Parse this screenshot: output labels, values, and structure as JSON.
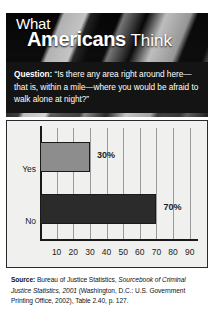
{
  "figure": {
    "title_line1": "What",
    "title_line2_bold": "Americans",
    "title_line2_light": "Think"
  },
  "question": {
    "label": "Question:",
    "text": " “Is there any area right around here—that is, within a mile—where you would be afraid to walk alone at night?”"
  },
  "chart_data": {
    "type": "bar",
    "orientation": "horizontal",
    "categories": [
      "Yes",
      "No"
    ],
    "values": [
      30,
      70
    ],
    "value_labels": [
      "30%",
      "70%"
    ],
    "title": "",
    "xlabel": "",
    "ylabel": "",
    "xlim": [
      0,
      95
    ],
    "xticks": [
      10,
      20,
      30,
      40,
      50,
      60,
      70,
      80,
      90
    ],
    "xtick_labels": [
      "10",
      "20",
      "30",
      "40",
      "50",
      "60",
      "70",
      "80",
      "90"
    ],
    "grid": "vertical",
    "legend": "none",
    "bar_colors": [
      "#8d8d8d",
      "#2b2b2b"
    ],
    "bar_edge_color": "#1a1a1a"
  },
  "source": {
    "label": "Source:",
    "part1": " Bureau of Justice Statistics, ",
    "italic1": "Sourcebook of Criminal Justice Statistics, 2001",
    "part2": " (Washington, D.C.: U.S. Government Printing Office, 2002), Table 2.40, p. 127."
  },
  "colors": {
    "panel_background": "#f0f0ee",
    "panel_border": "#2b2b2b",
    "question_background": "#141414",
    "question_text": "#ffffff",
    "gridline": "#9a9a9a",
    "axis": "#1a1a1a"
  }
}
